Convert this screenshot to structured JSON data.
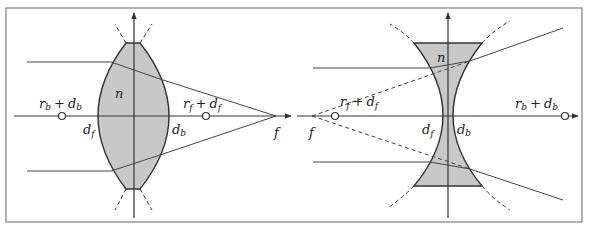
{
  "figure": {
    "colors": {
      "background": "#ffffff",
      "border": "#555555",
      "lens_fill": "#c8c8c8",
      "stroke": "#333333"
    },
    "left_panel": {
      "lens_type": "converging (biconvex)",
      "labels": {
        "refractive_index": "n",
        "back_center": "r_b + d_b",
        "front_center": "r_f + d_f",
        "front_surface": "d_f",
        "back_surface": "d_b",
        "focal_point": "f"
      }
    },
    "right_panel": {
      "lens_type": "diverging (biconcave)",
      "labels": {
        "refractive_index": "n",
        "front_center": "r_f + d_f",
        "back_center": "r_b + d_b",
        "front_surface": "d_f",
        "back_surface": "d_b",
        "focal_point": "f"
      }
    }
  },
  "text": {
    "n": "n",
    "f": "f",
    "r": "r",
    "d": "d",
    "plus": "+",
    "sub_b": "b",
    "sub_f": "f"
  }
}
